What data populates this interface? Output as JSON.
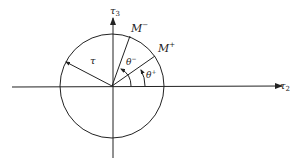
{
  "diagram": {
    "axes": {
      "horizontal": {
        "label": "τ",
        "subscript": "2"
      },
      "vertical": {
        "label": "τ",
        "subscript": "3"
      }
    },
    "circle": {
      "radius_label": "τ"
    },
    "points": [
      {
        "label": "M",
        "superscript": "−"
      },
      {
        "label": "M",
        "superscript": "+"
      }
    ],
    "angles": [
      {
        "label": "θ",
        "superscript": "−"
      },
      {
        "label": "θ",
        "superscript": "+"
      }
    ],
    "colors": {
      "ink": "#222222",
      "background": "#ffffff"
    }
  }
}
